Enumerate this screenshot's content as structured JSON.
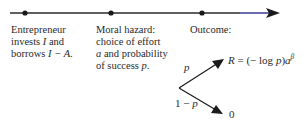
{
  "timeline": {
    "stages": [
      {
        "lines": [
          {
            "pre": "Entrepreneur",
            "var": "",
            "post": ""
          },
          {
            "pre": "invests ",
            "var": "I",
            "post": " and"
          },
          {
            "pre": "borrows ",
            "var": "I − A",
            "post": "."
          }
        ]
      },
      {
        "lines": [
          {
            "pre": "Moral hazard:",
            "var": "",
            "post": ""
          },
          {
            "pre": "choice of effort",
            "var": "",
            "post": ""
          },
          {
            "pre": "",
            "var": "a",
            "post": " and probability"
          },
          {
            "pre": "of success ",
            "var": "p",
            "post": "."
          }
        ]
      },
      {
        "lines": [
          {
            "pre": "Outcome:",
            "var": "",
            "post": ""
          }
        ]
      }
    ],
    "line_color": "#2a2a2a",
    "arrow_tip_color": "#1a1a8a"
  },
  "tree": {
    "branch_up_label": "p",
    "branch_down_label": "1 − p",
    "success_payoff": {
      "lhs": "R",
      "eq": " = (− log ",
      "p": "p",
      "close": ")",
      "a": "a",
      "exp": "β"
    },
    "failure_payoff": "0"
  }
}
